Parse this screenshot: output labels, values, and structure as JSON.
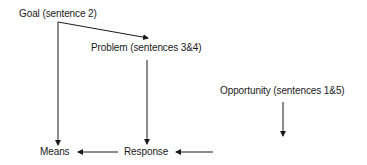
{
  "diagram": {
    "nodes": {
      "goal": {
        "label": "Goal (sentence 2)"
      },
      "problem": {
        "label": "Problem (sentences 3&4)"
      },
      "opportunity": {
        "label": "Opportunity (sentences 1&5)"
      },
      "means": {
        "label": "Means"
      },
      "response": {
        "label": "Response"
      }
    },
    "edges": [
      {
        "from": "goal",
        "to": "problem"
      },
      {
        "from": "goal",
        "to": "means"
      },
      {
        "from": "problem",
        "to": "response"
      },
      {
        "from": "opportunity",
        "to": "response"
      },
      {
        "from": "response",
        "to": "means"
      }
    ],
    "line_color": "#1a1a1a"
  }
}
